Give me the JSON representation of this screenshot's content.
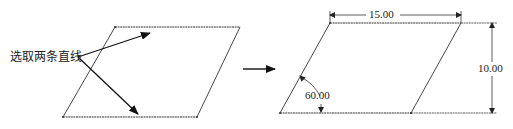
{
  "diagram": {
    "before": {
      "instruction_label": "选取两条直线",
      "shape": "parallelogram"
    },
    "transition_arrow": "right-arrow",
    "after": {
      "shape": "parallelogram",
      "dimensions": {
        "horizontal": "15.00",
        "vertical": "10.00",
        "angle": "60.00"
      }
    },
    "colors": {
      "line": "#333333",
      "background": "#ffffff"
    }
  }
}
